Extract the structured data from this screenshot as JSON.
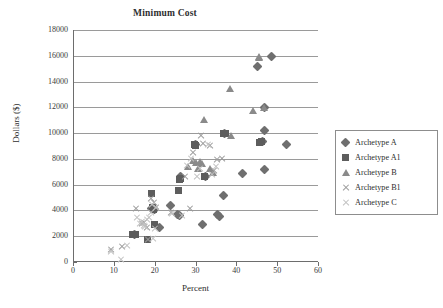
{
  "chart_data": {
    "type": "scatter",
    "title": "Minimum Cost",
    "xlabel": "Percent",
    "ylabel": "Dollars ($)",
    "xlim": [
      0,
      60
    ],
    "ylim": [
      0,
      18000
    ],
    "xticks": [
      0,
      10,
      20,
      30,
      40,
      50,
      60
    ],
    "yticks": [
      0,
      2000,
      4000,
      6000,
      8000,
      10000,
      12000,
      14000,
      16000,
      18000
    ],
    "grid": "horizontal",
    "legend_position": "right",
    "series": [
      {
        "name": "Archetype A",
        "marker": "diamond",
        "color": "#6f6f6f",
        "points": [
          [
            15.0,
            2150
          ],
          [
            19.3,
            4150
          ],
          [
            20.0,
            4100
          ],
          [
            21.3,
            2650
          ],
          [
            23.8,
            4400
          ],
          [
            25.5,
            3650
          ],
          [
            26.0,
            3600
          ],
          [
            26.3,
            6600
          ],
          [
            30.0,
            9100
          ],
          [
            31.8,
            2900
          ],
          [
            32.5,
            6600
          ],
          [
            35.3,
            3700
          ],
          [
            35.8,
            3500
          ],
          [
            36.8,
            5150
          ],
          [
            37.0,
            9950
          ],
          [
            41.5,
            6900
          ],
          [
            45.3,
            15150
          ],
          [
            46.5,
            9350
          ],
          [
            46.8,
            10200
          ],
          [
            46.9,
            11950
          ],
          [
            47.0,
            7150
          ],
          [
            48.7,
            15950
          ],
          [
            52.2,
            9100
          ]
        ]
      },
      {
        "name": "Archetype A1",
        "marker": "square",
        "color": "#5d5d5d",
        "points": [
          [
            14.6,
            2100
          ],
          [
            15.2,
            2150
          ],
          [
            18.2,
            1750
          ],
          [
            19.3,
            5300
          ],
          [
            19.5,
            4250
          ],
          [
            19.6,
            4100
          ],
          [
            19.9,
            2900
          ],
          [
            25.9,
            5550
          ],
          [
            26.2,
            6400
          ],
          [
            26.3,
            6500
          ],
          [
            29.7,
            9150
          ],
          [
            30.0,
            9050
          ],
          [
            32.3,
            6600
          ],
          [
            36.9,
            9950
          ],
          [
            37.3,
            10000
          ],
          [
            45.6,
            9250
          ],
          [
            46.2,
            9350
          ]
        ]
      },
      {
        "name": "Archetype B",
        "marker": "triangle",
        "color": "#8a8a8a",
        "points": [
          [
            28.2,
            7400
          ],
          [
            29.4,
            7800
          ],
          [
            30.2,
            7650
          ],
          [
            30.6,
            7200
          ],
          [
            31.2,
            7750
          ],
          [
            31.6,
            7600
          ],
          [
            32.2,
            11000
          ],
          [
            33.6,
            7250
          ],
          [
            34.3,
            6900
          ],
          [
            38.4,
            13450
          ],
          [
            38.6,
            9800
          ],
          [
            44.0,
            11700
          ],
          [
            45.5,
            15900
          ],
          [
            45.6,
            15850
          ],
          [
            46.8,
            11950
          ]
        ]
      },
      {
        "name": "Archetype B1",
        "marker": "x",
        "color": "#9b9b9b",
        "points": [
          [
            9.2,
            950
          ],
          [
            12.0,
            1150
          ],
          [
            15.4,
            4150
          ],
          [
            17.0,
            2950
          ],
          [
            17.5,
            3050
          ],
          [
            18.0,
            2650
          ],
          [
            18.3,
            1700
          ],
          [
            19.2,
            4900
          ],
          [
            19.8,
            4600
          ],
          [
            20.4,
            4200
          ],
          [
            24.0,
            3800
          ],
          [
            27.5,
            6600
          ],
          [
            28.7,
            4150
          ],
          [
            29.3,
            8500
          ],
          [
            31.3,
            9800
          ],
          [
            31.8,
            9200
          ],
          [
            33.5,
            9000
          ],
          [
            34.6,
            7100
          ],
          [
            35.3,
            7900
          ],
          [
            36.5,
            8050
          ]
        ]
      },
      {
        "name": "Archetype C",
        "marker": "star",
        "color": "#c0c0c0",
        "points": [
          [
            9.2,
            800
          ],
          [
            11.8,
            200
          ],
          [
            13.2,
            1250
          ],
          [
            15.6,
            3450
          ],
          [
            16.3,
            3000
          ],
          [
            16.8,
            3150
          ],
          [
            17.3,
            2850
          ],
          [
            17.6,
            2700
          ],
          [
            18.1,
            3250
          ],
          [
            18.6,
            3450
          ],
          [
            19.0,
            3800
          ],
          [
            19.4,
            4450
          ],
          [
            19.6,
            1800
          ],
          [
            20.0,
            2600
          ],
          [
            20.3,
            4250
          ],
          [
            24.2,
            3750
          ],
          [
            26.6,
            3600
          ],
          [
            28.0,
            7450
          ],
          [
            29.0,
            8050
          ],
          [
            30.3,
            6650
          ],
          [
            31.0,
            7200
          ],
          [
            33.0,
            9100
          ],
          [
            34.1,
            6800
          ],
          [
            35.0,
            7400
          ]
        ]
      }
    ]
  }
}
